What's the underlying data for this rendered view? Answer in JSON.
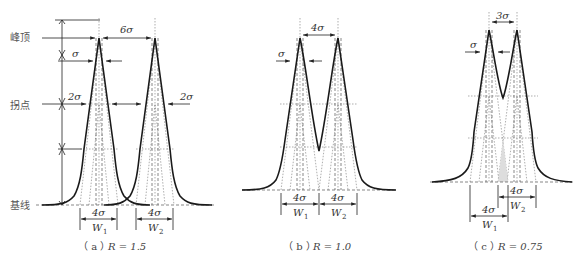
{
  "labels": {
    "peak_top": "峰顶",
    "inflection": "拐点",
    "baseline": "基线"
  },
  "panels": [
    {
      "id": "a",
      "caption_prefix": "（ a ）",
      "caption_R": "R = 1.5",
      "peak_separation": "6σ",
      "sigma_label": "σ",
      "inflection_left": "2σ",
      "inflection_right": "2σ",
      "width1_value": "4σ",
      "width1_name": "W",
      "width1_sub": "1",
      "width2_value": "4σ",
      "width2_name": "W",
      "width2_sub": "2"
    },
    {
      "id": "b",
      "caption_prefix": "（ b ）",
      "caption_R": "R = 1.0",
      "peak_separation": "4σ",
      "sigma_label": "σ",
      "width1_value": "4σ",
      "width1_name": "W",
      "width1_sub": "1",
      "width2_value": "4σ",
      "width2_name": "W",
      "width2_sub": "2"
    },
    {
      "id": "c",
      "caption_prefix": "（ c ）",
      "caption_R": "R = 0.75",
      "peak_separation": "3σ",
      "sigma_label": "σ",
      "width1_value": "4σ",
      "width1_name": "W",
      "width1_sub": "1",
      "width2_value": "4σ",
      "width2_name": "W",
      "width2_sub": "2"
    }
  ],
  "colors": {
    "curve": "#1a1a1a",
    "guides": "#777777",
    "text": "#333333"
  }
}
